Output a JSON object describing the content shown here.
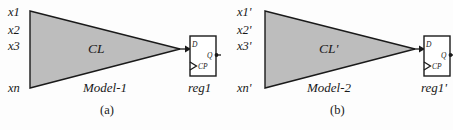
{
  "figure": {
    "caption_a": "(a)",
    "caption_b": "(b)",
    "fill_color": "#bdbdbd",
    "stroke_color": "#1a1a1a",
    "background": "#fdfdfd"
  },
  "panel_a": {
    "inputs": [
      "x1",
      "x2",
      "x3",
      "xn"
    ],
    "block_label": "CL",
    "model_label": "Model-1",
    "register": {
      "name": "reg1",
      "pin_d": "D",
      "pin_q": "Q",
      "pin_cp": "CP"
    }
  },
  "panel_b": {
    "inputs": [
      "x1'",
      "x2'",
      "x3'",
      "xn'"
    ],
    "block_label": "CL'",
    "model_label": "Model-2",
    "register": {
      "name": "reg1'",
      "pin_d": "D",
      "pin_q": "Q",
      "pin_cp": "CP"
    }
  }
}
